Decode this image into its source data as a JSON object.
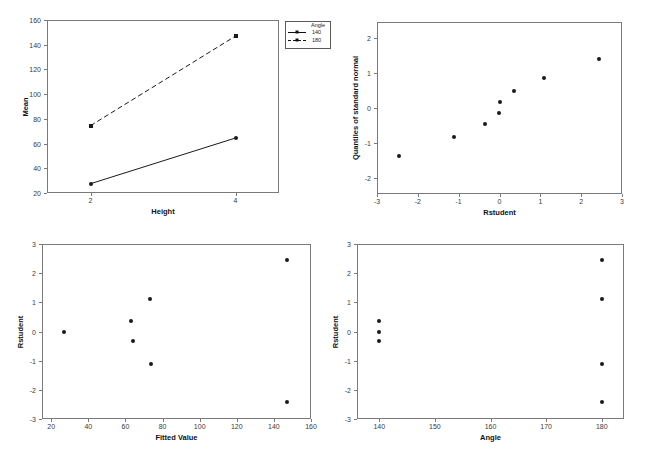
{
  "figure": {
    "suptitle": "",
    "panel_count": 4
  },
  "chart_data": [
    {
      "id": "interaction-plot",
      "type": "line",
      "title": "",
      "xlabel": "Height",
      "ylabel": "Mean",
      "xlim": [
        1.4,
        4.6
      ],
      "ylim": [
        20,
        160
      ],
      "xticks": [
        "2",
        "4"
      ],
      "xtick_values": [
        2,
        4
      ],
      "yticks": [
        "20",
        "40",
        "60",
        "80",
        "100",
        "120",
        "140",
        "160"
      ],
      "ytick_values": [
        20,
        40,
        60,
        80,
        100,
        120,
        140,
        160
      ],
      "grid": false,
      "legend": {
        "title": "Angle",
        "position": "outside-top-right",
        "entries": [
          {
            "label": "140",
            "style": "solid",
            "marker": "circle"
          },
          {
            "label": "180",
            "style": "dashed",
            "marker": "square"
          }
        ]
      },
      "x": [
        2,
        4
      ],
      "series": [
        {
          "name": "140",
          "style": "solid",
          "marker": "circle",
          "values": [
            27.5,
            64.5
          ]
        },
        {
          "name": "180",
          "style": "dashed",
          "marker": "square",
          "values": [
            74.5,
            147.0
          ]
        }
      ]
    },
    {
      "id": "normal-qq-plot",
      "type": "scatter",
      "title": "",
      "xlabel": "Rstudent",
      "ylabel": "Quantiles of standard normal",
      "xlim": [
        -3,
        3
      ],
      "ylim": [
        -2.45,
        2.45
      ],
      "xticks": [
        "-3",
        "-2",
        "-1",
        "0",
        "1",
        "2",
        "3"
      ],
      "xtick_values": [
        -3,
        -2,
        -1,
        0,
        1,
        2,
        3
      ],
      "yticks": [
        "-2",
        "-1",
        "0",
        "1",
        "2"
      ],
      "ytick_values": [
        -2,
        -1,
        0,
        1,
        2
      ],
      "grid": false,
      "points": [
        {
          "x": -2.46,
          "y": -1.37
        },
        {
          "x": -1.12,
          "y": -0.82
        },
        {
          "x": -0.35,
          "y": -0.46
        },
        {
          "x": -0.02,
          "y": -0.14
        },
        {
          "x": 0.0,
          "y": 0.17
        },
        {
          "x": 0.35,
          "y": 0.49
        },
        {
          "x": 1.1,
          "y": 0.85
        },
        {
          "x": 2.44,
          "y": 1.4
        }
      ]
    },
    {
      "id": "rstudent-vs-fitted-plot",
      "type": "scatter",
      "title": "",
      "xlabel": "Fitted Value",
      "ylabel": "Rstudent",
      "xlim": [
        15,
        160
      ],
      "ylim": [
        -3,
        3
      ],
      "xticks": [
        "20",
        "40",
        "60",
        "80",
        "100",
        "120",
        "140",
        "160"
      ],
      "xtick_values": [
        20,
        40,
        60,
        80,
        100,
        120,
        140,
        160
      ],
      "yticks": [
        "-3",
        "-2",
        "-1",
        "0",
        "1",
        "2",
        "3"
      ],
      "ytick_values": [
        -3,
        -2,
        -1,
        0,
        1,
        2,
        3
      ],
      "grid": false,
      "points": [
        {
          "x": 27,
          "y": 0.0
        },
        {
          "x": 63,
          "y": 0.36
        },
        {
          "x": 64,
          "y": -0.33
        },
        {
          "x": 73,
          "y": 1.13
        },
        {
          "x": 73.5,
          "y": -1.1
        },
        {
          "x": 147,
          "y": 2.45
        },
        {
          "x": 147,
          "y": -2.4
        }
      ]
    },
    {
      "id": "rstudent-vs-angle-plot",
      "type": "scatter",
      "title": "",
      "xlabel": "Angle",
      "ylabel": "Rstudent",
      "xlim": [
        136,
        184
      ],
      "ylim": [
        -3,
        3
      ],
      "xticks": [
        "140",
        "150",
        "160",
        "170",
        "180"
      ],
      "xtick_values": [
        140,
        150,
        160,
        170,
        180
      ],
      "yticks": [
        "-3",
        "-2",
        "-1",
        "0",
        "1",
        "2",
        "3"
      ],
      "ytick_values": [
        -3,
        -2,
        -1,
        0,
        1,
        2,
        3
      ],
      "grid": false,
      "points": [
        {
          "x": 140,
          "y": 0.36
        },
        {
          "x": 140,
          "y": 0.0
        },
        {
          "x": 140,
          "y": -0.33
        },
        {
          "x": 180,
          "y": 2.45
        },
        {
          "x": 180,
          "y": 1.12
        },
        {
          "x": 180,
          "y": -1.1
        },
        {
          "x": 180,
          "y": -2.4
        }
      ]
    }
  ]
}
